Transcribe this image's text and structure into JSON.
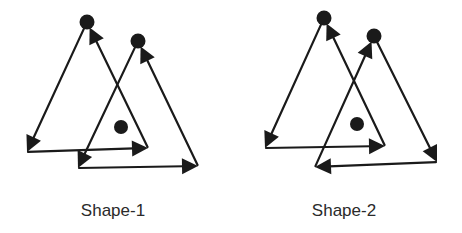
{
  "figure": {
    "stroke_color": "#1a1a1a",
    "shapes": [
      {
        "id": "shape-1",
        "label": "Shape-1",
        "label_pos": [
          113,
          201
        ],
        "triangles": [
          {
            "name": "triangle-a",
            "vertices": {
              "apex": [
                87,
                22
              ],
              "bottom_left": [
                27,
                152
              ],
              "bottom_right": [
                148,
                148
              ]
            },
            "apex_dot": true,
            "edges": [
              {
                "from": "apex",
                "to": "bottom_left"
              },
              {
                "from": "bottom_left",
                "to": "bottom_right"
              },
              {
                "from": "bottom_right",
                "to": "apex"
              }
            ]
          },
          {
            "name": "triangle-b",
            "vertices": {
              "apex": [
                138,
                41
              ],
              "bottom_left": [
                78,
                168
              ],
              "bottom_right": [
                198,
                166
              ]
            },
            "apex_dot": true,
            "edges": [
              {
                "from": "apex",
                "to": "bottom_left"
              },
              {
                "from": "bottom_left",
                "to": "bottom_right"
              },
              {
                "from": "bottom_right",
                "to": "apex"
              }
            ]
          }
        ],
        "free_dot": [
          121,
          127
        ]
      },
      {
        "id": "shape-2",
        "label": "Shape-2",
        "label_pos": [
          344,
          201
        ],
        "triangles": [
          {
            "name": "triangle-a",
            "vertices": {
              "apex": [
                324,
                18
              ],
              "bottom_left": [
                265,
                148
              ],
              "bottom_right": [
                385,
                146
              ]
            },
            "apex_dot": true,
            "edges": [
              {
                "from": "apex",
                "to": "bottom_left"
              },
              {
                "from": "bottom_left",
                "to": "bottom_right"
              },
              {
                "from": "bottom_right",
                "to": "apex"
              }
            ]
          },
          {
            "name": "triangle-b",
            "vertices": {
              "apex": [
                374,
                36
              ],
              "bottom_left": [
                315,
                167
              ],
              "bottom_right": [
                437,
                162
              ]
            },
            "apex_dot": true,
            "edges": [
              {
                "from": "apex",
                "to": "bottom_right"
              },
              {
                "from": "bottom_right",
                "to": "bottom_left"
              },
              {
                "from": "bottom_left",
                "to": "apex"
              }
            ]
          }
        ],
        "free_dot": [
          357,
          124
        ]
      }
    ]
  }
}
